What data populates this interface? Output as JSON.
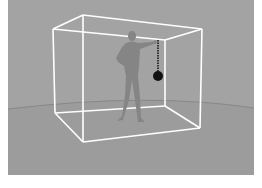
{
  "image": {
    "description": "Rendered scene of a gray human figure standing inside a white wireframe box, holding a chain with a black ball hanging from it",
    "colors": {
      "background": "#a3a3a3",
      "floor": "#9c9c9c",
      "box_edges": "#ffffff",
      "figure": "#858585",
      "ball": "#111111",
      "horizon": "#8a8a8a"
    },
    "box": {
      "top": [
        [
          53,
          29
        ],
        [
          83,
          15
        ],
        [
          202,
          29
        ],
        [
          165,
          40
        ]
      ],
      "bottom": [
        [
          55,
          113
        ],
        [
          83,
          142
        ],
        [
          200,
          128
        ],
        [
          165,
          106
        ]
      ]
    },
    "pendulum": {
      "pivot": [
        158,
        40
      ],
      "ball_center": [
        158,
        76
      ],
      "ball_radius": 5
    }
  }
}
